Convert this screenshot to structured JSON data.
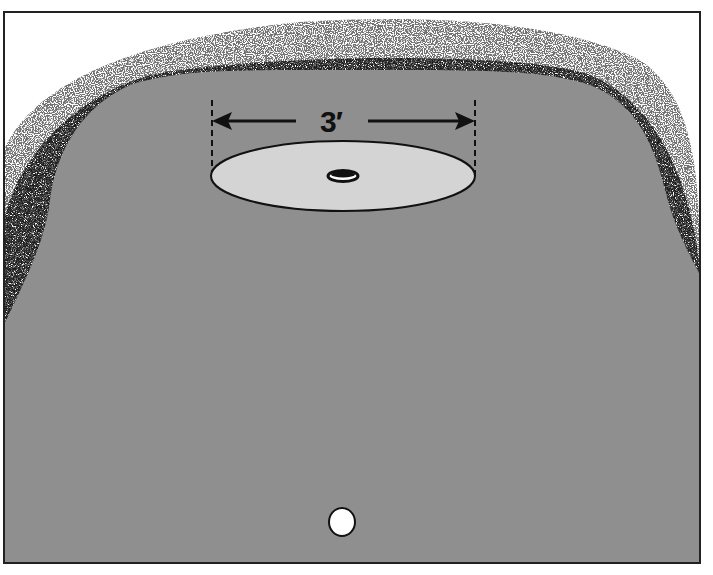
{
  "figure": {
    "dimension_label": "3′",
    "colors": {
      "green": "#8f8f8f",
      "circle_fill": "#d4d4d4",
      "rough_stipple": "#1a1a1a",
      "background": "#ffffff",
      "frame": "#222222",
      "ball": "#ffffff"
    },
    "elements": [
      {
        "name": "rough",
        "description": "stippled fringe around green"
      },
      {
        "name": "green",
        "description": "gray putting surface"
      },
      {
        "name": "target-circle",
        "description": "light ellipse 3 feet across"
      },
      {
        "name": "hole",
        "description": "cup in center of circle"
      },
      {
        "name": "ball",
        "description": "white golf ball at bottom"
      }
    ]
  }
}
